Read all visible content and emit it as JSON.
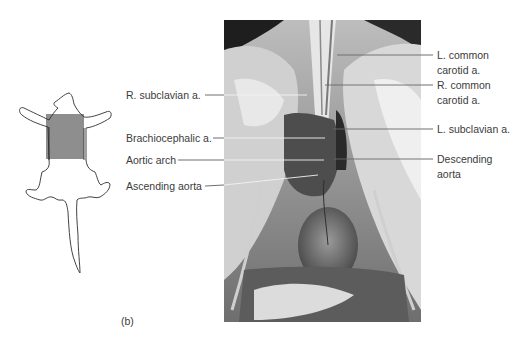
{
  "figure": {
    "panel_label": "(b)",
    "colors": {
      "shaded_region": "#8e8e8e",
      "outline": "#2e2e2e",
      "leader_line": "#4a4a4a",
      "leader_line_on_photo": "#f2f2f2",
      "text": "#3b3b3b"
    },
    "orientation_sketch": {
      "description": "rat outline with shaded thoracic region"
    },
    "photo": {
      "description": "grayscale dissection photograph of rat thoracic cavity showing heart and great vessels"
    },
    "labels_left": [
      {
        "text": "R. subclavian a."
      },
      {
        "text": "Brachiocephalic a."
      },
      {
        "text": "Aortic arch"
      },
      {
        "text": "Ascending aorta"
      }
    ],
    "labels_right": [
      {
        "line1": "L. common",
        "line2": "carotid a."
      },
      {
        "line1": "R. common",
        "line2": "carotid a."
      },
      {
        "line1": "L. subclavian a.",
        "line2": ""
      },
      {
        "line1": "Descending",
        "line2": "aorta"
      }
    ]
  }
}
